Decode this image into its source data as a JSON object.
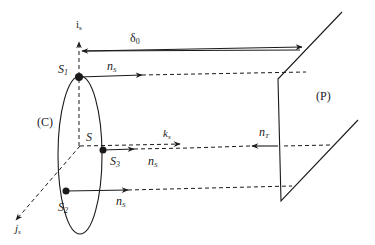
{
  "labels": {
    "axis_i": "i",
    "axis_i_sub": "s",
    "axis_j": "j",
    "axis_j_sub": "s",
    "delta": "δ",
    "delta_sub": "0",
    "S1": "S",
    "S1_sub": "1",
    "S2": "S",
    "S2_sub": "2",
    "S3": "S",
    "S3_sub": "3",
    "origin": "S",
    "ns_1": "n",
    "ns_1_sub": "S",
    "ns_2": "n",
    "ns_2_sub": "S",
    "ns_3": "n",
    "ns_3_sub": "S",
    "ks": "k",
    "ks_sub": "s",
    "nT": "n",
    "nT_sub": "T",
    "curve": "(C)",
    "plane": "(P)"
  },
  "colors": {
    "ink": "#1a1a1a",
    "background": "#ffffff"
  }
}
